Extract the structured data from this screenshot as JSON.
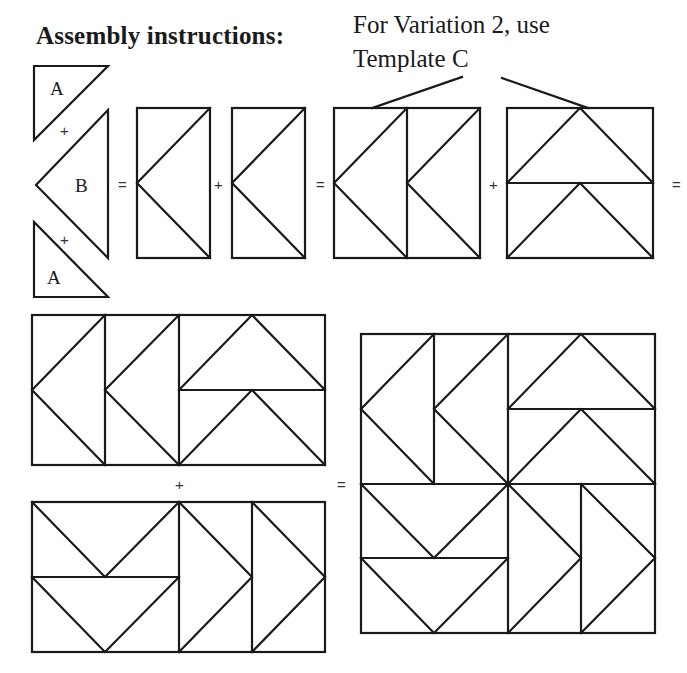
{
  "header": {
    "title": "Assembly instructions:",
    "note_line1": "For Variation 2, use",
    "note_line2": "Template C"
  },
  "pieces": {
    "triangle_a_top_label": "A",
    "triangle_b_label": "B",
    "triangle_a_bottom_label": "A"
  },
  "operators": {
    "plus": "+",
    "equals": "="
  },
  "steps": [
    {
      "id": 1,
      "description": "A + B + A = flying geese unit (rectangle)"
    },
    {
      "id": 2,
      "description": "Unit + unit = pair of left-pointing geese"
    },
    {
      "id": 3,
      "description": "Pair + two up-pointing geese (Template C for Variation 2) = top half"
    },
    {
      "id": 4,
      "description": "Top half + bottom half = finished square block"
    }
  ],
  "colors": {
    "line": "#1a1a1a",
    "background": "#ffffff"
  }
}
